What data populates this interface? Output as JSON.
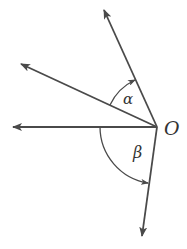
{
  "diagram": {
    "type": "angle-diagram",
    "stroke_color": "#4a4a4a",
    "origin": {
      "label": "O",
      "x": 157,
      "y": 127
    },
    "rays": [
      {
        "name": "ray-up",
        "tip": [
          103,
          8
        ]
      },
      {
        "name": "ray-upper-left",
        "tip": [
          19,
          63
        ]
      },
      {
        "name": "ray-left",
        "tip": [
          12,
          127
        ]
      },
      {
        "name": "ray-down",
        "tip": [
          142,
          238
        ]
      }
    ],
    "angles": [
      {
        "label": "α",
        "between": [
          "ray-upper-left",
          "ray-up"
        ],
        "label_pos": [
          127,
          103
        ]
      },
      {
        "label": "β",
        "between": [
          "ray-left",
          "ray-down"
        ],
        "label_pos": [
          137,
          157
        ]
      }
    ]
  }
}
